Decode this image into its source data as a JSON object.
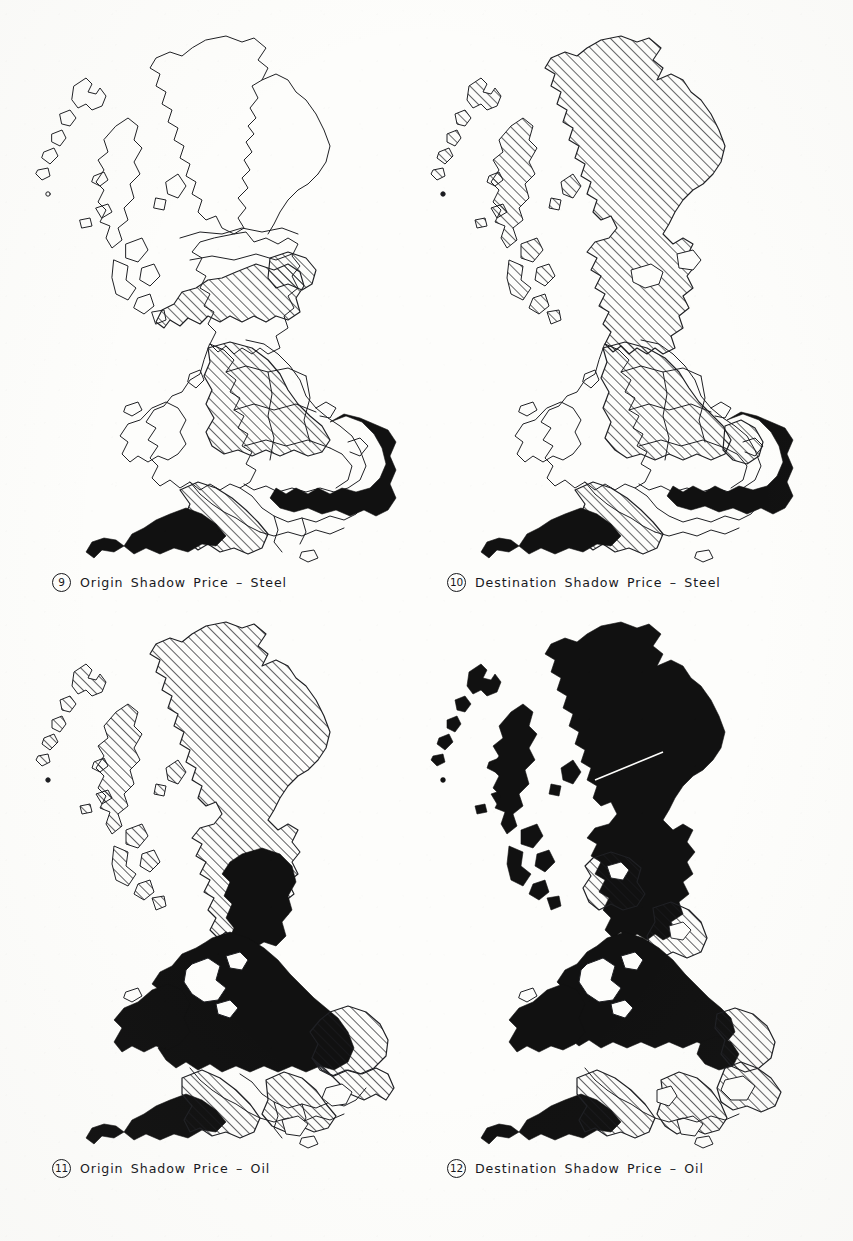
{
  "figure": {
    "kind": "choropleth-map-series",
    "region": "Great Britain",
    "panel_count": 4
  },
  "colors": {
    "paper": "#fdfdfb",
    "ink": "#15161a",
    "solid_fill": "#111111",
    "hatch_stroke": "#1a1b1f",
    "outline": "#1f2024"
  },
  "panels": [
    {
      "id": "panel-9",
      "number": "9",
      "caption": "Origin Shadow Price – Steel",
      "commodity": "Steel",
      "price_type": "Origin",
      "position": "top-left",
      "fill_summary": {
        "solid_black": [
          "East Anglia",
          "South East",
          "Greater London",
          "South West (Cornwall/Devon)"
        ],
        "hatched": [
          "Central Scotland",
          "Strathclyde",
          "North West England",
          "West Midlands",
          "East Midlands",
          "Yorkshire & Humberside (part)",
          "Southern England (Wessex)"
        ],
        "white": [
          "Highlands",
          "Grampian",
          "Northern Scotland",
          "Wales",
          "Northern England (part)"
        ]
      }
    },
    {
      "id": "panel-10",
      "number": "10",
      "caption": "Destination Shadow Price – Steel",
      "commodity": "Steel",
      "price_type": "Destination",
      "position": "top-right",
      "fill_summary": {
        "solid_black": [
          "East Anglia",
          "South East",
          "Greater London",
          "South West (Cornwall/Devon)"
        ],
        "hatched": [
          "Highlands & Islands",
          "Grampian",
          "Tayside",
          "Central Scotland",
          "Strathclyde",
          "Borders",
          "North East England",
          "North West England",
          "West Midlands",
          "East Midlands",
          "Southern England (Wessex)"
        ],
        "white": [
          "Wales",
          "Cumbria (part)",
          "Hampshire/Dorset (part)"
        ]
      }
    },
    {
      "id": "panel-11",
      "number": "11",
      "caption": "Origin Shadow Price – Oil",
      "commodity": "Oil",
      "price_type": "Origin",
      "position": "bottom-left",
      "fill_summary": {
        "solid_black": [
          "Central Scotland (part)",
          "Northern England",
          "Yorkshire & Humberside",
          "North West England",
          "Wales",
          "West Midlands",
          "East Midlands",
          "South West (Cornwall/Devon)"
        ],
        "hatched": [
          "Highlands & Islands",
          "Grampian",
          "Tayside",
          "Strathclyde",
          "Borders",
          "East Anglia",
          "South East",
          "Southern England (Wessex)"
        ],
        "white": [
          "Greater London (part)",
          "Hampshire/Sussex coast"
        ]
      }
    },
    {
      "id": "panel-12",
      "number": "12",
      "caption": "Destination Shadow Price – Oil",
      "commodity": "Oil",
      "price_type": "Destination",
      "position": "bottom-right",
      "fill_summary": {
        "solid_black": [
          "Highlands & Islands",
          "Grampian",
          "Tayside",
          "Northern Scotland",
          "Northern England",
          "Yorkshire & Humberside",
          "North West England",
          "Wales",
          "West Midlands",
          "East Midlands",
          "South West (Cornwall/Devon)"
        ],
        "hatched": [
          "Central Scotland",
          "Strathclyde",
          "Borders",
          "Lincolnshire",
          "East Anglia",
          "Southern England (Wessex)",
          "Sussex"
        ],
        "white": [
          "Greater London (part)",
          "Hampshire/Dorset (part)"
        ]
      }
    }
  ],
  "legend_keys": {
    "solid": "solid black fill",
    "hatched": "diagonal hatch fill",
    "blank": "no fill (outline only)"
  }
}
